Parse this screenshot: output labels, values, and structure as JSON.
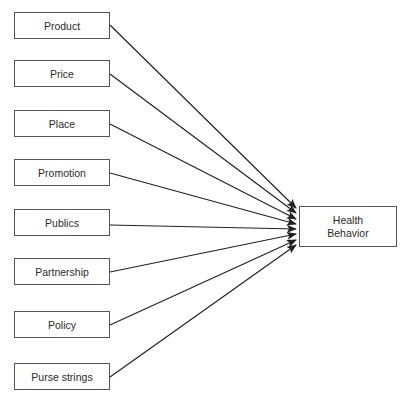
{
  "diagram": {
    "factors": [
      {
        "label": "Product",
        "top": 12
      },
      {
        "label": "Price",
        "top": 60
      },
      {
        "label": "Place",
        "top": 110
      },
      {
        "label": "Promotion",
        "top": 159
      },
      {
        "label": "Publics",
        "top": 209
      },
      {
        "label": "Partnership",
        "top": 258
      },
      {
        "label": "Policy",
        "top": 311
      },
      {
        "label": "Purse strings",
        "top": 363
      }
    ],
    "outcome": {
      "line1": "Health",
      "line2": "Behavior"
    }
  }
}
